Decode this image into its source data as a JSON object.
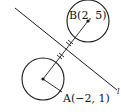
{
  "figure": {
    "point_a": {
      "label": "A(−2, 1)",
      "cx": 43,
      "cy": 79
    },
    "point_b": {
      "label": "B(2, 5)",
      "cx": 88,
      "cy": 21
    },
    "circle_radius": 21,
    "line_label": "l",
    "stroke_color": "#1a1a1a"
  }
}
